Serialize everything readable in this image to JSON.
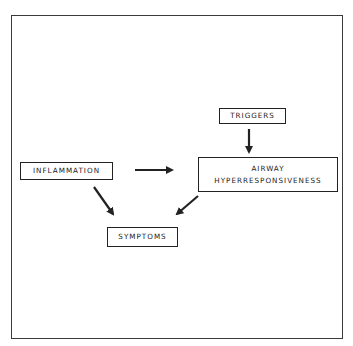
{
  "diagram": {
    "nodes": {
      "triggers": {
        "label": "TRIGGERS"
      },
      "airway": {
        "line1": "AIRWAY",
        "line2": "HYPERRESPONSIVENESS"
      },
      "inflammation": {
        "label": "INFLAMMATION"
      },
      "symptoms": {
        "label": "SYMPTOMS"
      }
    },
    "edges": [
      {
        "from": "triggers",
        "to": "airway"
      },
      {
        "from": "inflammation",
        "to": "airway"
      },
      {
        "from": "inflammation",
        "to": "symptoms"
      },
      {
        "from": "airway",
        "to": "symptoms"
      }
    ],
    "colors": {
      "stroke": "#222222",
      "frame": "#3a3a3a",
      "background": "#ffffff"
    }
  }
}
